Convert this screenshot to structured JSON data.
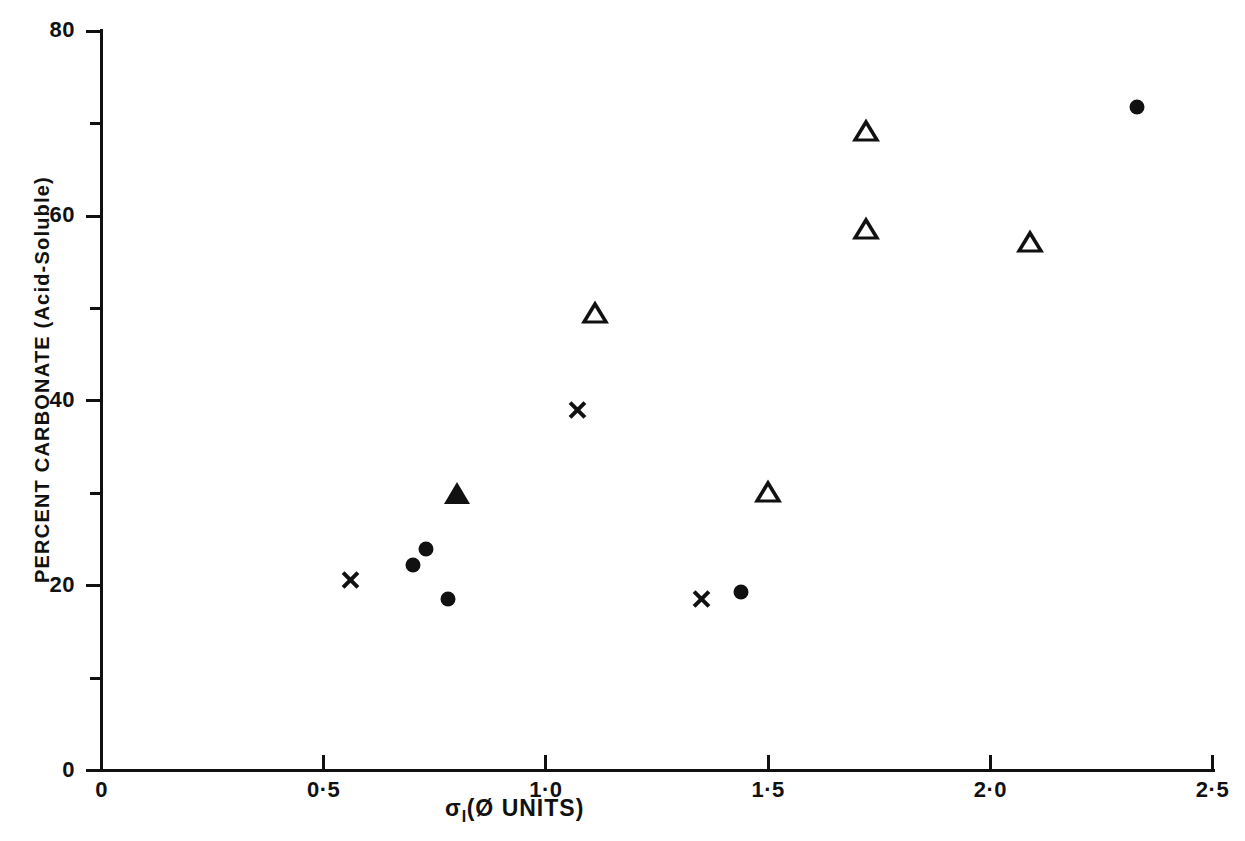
{
  "chart_data": {
    "type": "scatter",
    "title": "",
    "xlabel": "σI (Ø UNITS)",
    "ylabel": "PERCENT CARBONATE (Acid-Soluble)",
    "xlim": [
      0,
      2.5
    ],
    "ylim": [
      0,
      80
    ],
    "grid": false,
    "legend": "none",
    "x_ticks": [
      {
        "value": 0,
        "label": "0"
      },
      {
        "value": 0.5,
        "label": "0·5"
      },
      {
        "value": 1.0,
        "label": "1·0"
      },
      {
        "value": 1.5,
        "label": "1·5"
      },
      {
        "value": 2.0,
        "label": "2·0"
      },
      {
        "value": 2.5,
        "label": "2·5"
      }
    ],
    "y_ticks": [
      {
        "value": 0,
        "label": "0",
        "minor": false
      },
      {
        "value": 10,
        "label": "",
        "minor": true
      },
      {
        "value": 20,
        "label": "20",
        "minor": false
      },
      {
        "value": 30,
        "label": "",
        "minor": true
      },
      {
        "value": 40,
        "label": "40",
        "minor": false
      },
      {
        "value": 50,
        "label": "",
        "minor": true
      },
      {
        "value": 60,
        "label": "60",
        "minor": false
      },
      {
        "value": 70,
        "label": "",
        "minor": true
      },
      {
        "value": 80,
        "label": "80",
        "minor": false
      }
    ],
    "series": [
      {
        "name": "cross",
        "marker": "cross",
        "color": "#111111",
        "points": [
          {
            "x": 0.56,
            "y": 20.6
          },
          {
            "x": 1.07,
            "y": 39.0
          },
          {
            "x": 1.35,
            "y": 18.6
          }
        ]
      },
      {
        "name": "filled-circle",
        "marker": "filled-circle",
        "color": "#111111",
        "points": [
          {
            "x": 0.7,
            "y": 22.2
          },
          {
            "x": 0.73,
            "y": 24.0
          },
          {
            "x": 0.78,
            "y": 18.6
          },
          {
            "x": 1.44,
            "y": 19.3
          },
          {
            "x": 2.33,
            "y": 71.8
          }
        ]
      },
      {
        "name": "filled-triangle",
        "marker": "filled-triangle",
        "color": "#111111",
        "points": [
          {
            "x": 0.8,
            "y": 30.0
          }
        ]
      },
      {
        "name": "open-triangle",
        "marker": "open-triangle",
        "color": "#111111",
        "points": [
          {
            "x": 1.11,
            "y": 49.6
          },
          {
            "x": 1.5,
            "y": 30.2
          },
          {
            "x": 1.72,
            "y": 69.3
          },
          {
            "x": 1.72,
            "y": 58.7
          },
          {
            "x": 2.09,
            "y": 57.3
          }
        ]
      }
    ]
  },
  "axis_titles": {
    "x_symbol": "σ",
    "x_subscript": "I",
    "x_rest": "(Ø UNITS)",
    "y": "PERCENT CARBONATE (Acid-Soluble)"
  }
}
